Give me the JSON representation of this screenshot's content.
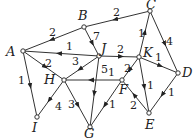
{
  "diagram": {
    "type": "directed-weighted-graph",
    "nodes": [
      {
        "id": "A",
        "x": 23,
        "y": 51,
        "lx": 6,
        "ly": 56
      },
      {
        "id": "B",
        "x": 84,
        "y": 27,
        "lx": 78,
        "ly": 20
      },
      {
        "id": "C",
        "x": 150,
        "y": 11,
        "lx": 146,
        "ly": 9
      },
      {
        "id": "J",
        "x": 99,
        "y": 56,
        "lx": 101,
        "ly": 53
      },
      {
        "id": "K",
        "x": 139,
        "y": 57,
        "lx": 143,
        "ly": 57
      },
      {
        "id": "D",
        "x": 178,
        "y": 73,
        "lx": 182,
        "ly": 77
      },
      {
        "id": "H",
        "x": 64,
        "y": 80,
        "lx": 44,
        "ly": 84
      },
      {
        "id": "F",
        "x": 122,
        "y": 80,
        "lx": 119,
        "ly": 94
      },
      {
        "id": "I",
        "x": 37,
        "y": 117,
        "lx": 32,
        "ly": 132
      },
      {
        "id": "G",
        "x": 90,
        "y": 127,
        "lx": 84,
        "ly": 138
      },
      {
        "id": "E",
        "x": 149,
        "y": 113,
        "lx": 145,
        "ly": 129
      }
    ],
    "edges": [
      {
        "from": "B",
        "to": "A",
        "weight": "2",
        "lx": 49,
        "ly": 36
      },
      {
        "from": "C",
        "to": "B",
        "weight": "2",
        "lx": 113,
        "ly": 16
      },
      {
        "from": "J",
        "to": "A",
        "weight": "1",
        "lx": 66,
        "ly": 50
      },
      {
        "from": "A",
        "to": "H",
        "weight": "2",
        "lx": 45,
        "ly": 67
      },
      {
        "from": "A",
        "to": "I",
        "weight": "1",
        "lx": 18,
        "ly": 84
      },
      {
        "from": "B",
        "to": "J",
        "weight": "7",
        "lx": 93,
        "ly": 40
      },
      {
        "from": "J",
        "to": "H",
        "weight": "3",
        "lx": 72,
        "ly": 65
      },
      {
        "from": "J",
        "to": "G",
        "weight": "5",
        "lx": 101,
        "ly": 73
      },
      {
        "from": "J",
        "to": "K",
        "weight": "2",
        "lx": 117,
        "ly": 53
      },
      {
        "from": "K",
        "to": "C",
        "weight": "1",
        "lx": 138,
        "ly": 37
      },
      {
        "from": "C",
        "to": "D",
        "weight": "4",
        "lx": 166,
        "ly": 45
      },
      {
        "from": "K",
        "to": "D",
        "weight": "1",
        "lx": 155,
        "ly": 61
      },
      {
        "from": "K",
        "to": "F",
        "weight": "2",
        "lx": 124,
        "ly": 72
      },
      {
        "from": "K",
        "to": "E",
        "weight": "1",
        "lx": 147,
        "ly": 89
      },
      {
        "from": "D",
        "to": "E",
        "weight": "1",
        "lx": 168,
        "ly": 96
      },
      {
        "from": "E",
        "to": "F",
        "weight": "2",
        "lx": 130,
        "ly": 109
      },
      {
        "from": "F",
        "to": "H",
        "weight": "1",
        "lx": 108,
        "ly": 76
      },
      {
        "from": "F",
        "to": "G",
        "weight": "1",
        "lx": 109,
        "ly": 108
      },
      {
        "from": "H",
        "to": "I",
        "weight": "4",
        "lx": 55,
        "ly": 110
      },
      {
        "from": "H",
        "to": "G",
        "weight": "3",
        "lx": 68,
        "ly": 108
      }
    ]
  },
  "colors": {
    "stroke": "#333333",
    "background": "#ffffff"
  }
}
